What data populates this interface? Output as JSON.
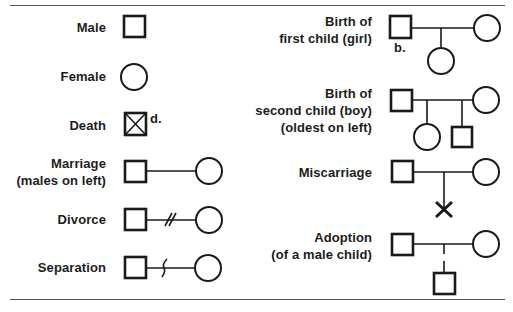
{
  "left_column": [
    {
      "id": "male",
      "label_lines": [
        "Male"
      ],
      "symbol": "square"
    },
    {
      "id": "female",
      "label_lines": [
        "Female"
      ],
      "symbol": "circle"
    },
    {
      "id": "death",
      "label_lines": [
        "Death"
      ],
      "symbol": "crossed-square",
      "annotation": "d."
    },
    {
      "id": "marriage",
      "label_lines": [
        "Marriage",
        "(males on left)"
      ],
      "symbol": "square-line-circle"
    },
    {
      "id": "divorce",
      "label_lines": [
        "Divorce"
      ],
      "symbol": "square-line-double-slash-circle"
    },
    {
      "id": "separation",
      "label_lines": [
        "Separation"
      ],
      "symbol": "square-line-wave-circle"
    }
  ],
  "right_column": [
    {
      "id": "birth-first-child",
      "label_lines": [
        "Birth of",
        "first child (girl)"
      ],
      "symbol": "couple-with-daughter",
      "annotation": "b."
    },
    {
      "id": "birth-second-child",
      "label_lines": [
        "Birth of",
        "second child (boy)",
        "(oldest on left)"
      ],
      "symbol": "couple-with-daughter-and-son"
    },
    {
      "id": "miscarriage",
      "label_lines": [
        "Miscarriage"
      ],
      "symbol": "couple-with-x"
    },
    {
      "id": "adoption",
      "label_lines": [
        "Adoption",
        "(of a male child)"
      ],
      "symbol": "couple-with-dashed-son"
    }
  ],
  "colors": {
    "ink": "#1a1a1a",
    "rule": "#555555",
    "background": "#ffffff"
  }
}
